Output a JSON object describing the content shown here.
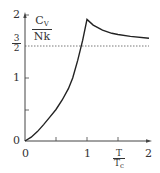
{
  "chart_data": {
    "type": "line",
    "title": "",
    "xlabel": "T/T_c",
    "ylabel": "C_V/Nk",
    "xlim": [
      0,
      2
    ],
    "ylim": [
      0,
      2
    ],
    "grid": false,
    "legend": null,
    "x_ticks": [
      0,
      0.5,
      1,
      1.5,
      2
    ],
    "x_tick_labels": [
      "0",
      "",
      "1",
      "",
      "2"
    ],
    "y_ticks": [
      0,
      0.5,
      1,
      1.5,
      2
    ],
    "y_tick_labels": [
      "0",
      "",
      "1",
      "3/2",
      "2"
    ],
    "series": [
      {
        "name": "C_V/Nk",
        "x": [
          0,
          0.1,
          0.2,
          0.3,
          0.4,
          0.5,
          0.6,
          0.7,
          0.77,
          0.85,
          0.93,
          1.0,
          1.1,
          1.25,
          1.4,
          1.5,
          1.7,
          2.0
        ],
        "y": [
          0,
          0.06,
          0.15,
          0.26,
          0.38,
          0.5,
          0.65,
          0.83,
          1.0,
          1.28,
          1.6,
          1.93,
          1.84,
          1.76,
          1.71,
          1.69,
          1.66,
          1.63
        ]
      }
    ],
    "annotations": [
      {
        "type": "hline",
        "y": 1.5,
        "style": "dashed",
        "label": "3/2"
      }
    ]
  },
  "labels": {
    "y_axis_num": "C",
    "y_axis_num_sub": "V",
    "y_axis_den": "Nk",
    "x_axis_num": "T",
    "x_axis_den": "T",
    "x_axis_den_sub": "c",
    "y_tick_2": "2",
    "y_tick_1": "1",
    "y_tick_0": "0",
    "y_tick_3half_num": "3",
    "y_tick_3half_den": "2",
    "x_tick_0": "0",
    "x_tick_1": "1",
    "x_tick_2": "2"
  },
  "colors": {
    "curve": "#222222",
    "axis": "#444444",
    "dashed": "#555555"
  }
}
